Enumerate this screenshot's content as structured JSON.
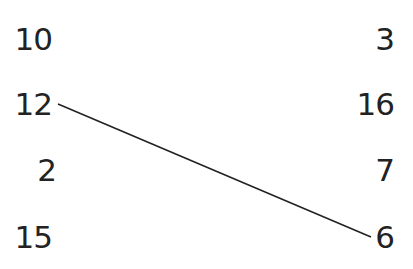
{
  "left_column": [
    "10",
    "12",
    "2",
    "15"
  ],
  "right_column": [
    "3",
    "16",
    "7",
    "6"
  ],
  "connections": [
    {
      "from_left": "12",
      "to_right": "6"
    }
  ],
  "colors": {
    "text": "#222222",
    "line": "#222222",
    "background": "#ffffff"
  }
}
